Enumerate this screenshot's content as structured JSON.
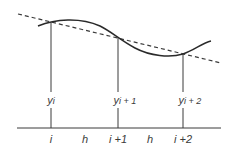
{
  "diagram": {
    "colors": {
      "stroke": "#3a3a3a",
      "background": "#ffffff"
    },
    "points": [
      {
        "x_px": 51,
        "y_px": 22,
        "y_label_base": "y",
        "y_label_sub": "i",
        "x_label": "i"
      },
      {
        "x_px": 118,
        "y_px": 38,
        "y_label_base": "y",
        "y_label_sub": "i + 1",
        "x_label": "i +1"
      },
      {
        "x_px": 183,
        "y_px": 54,
        "y_label_base": "y",
        "y_label_sub": "i + 2",
        "x_label": "i +2"
      }
    ],
    "spacing_labels": [
      "h",
      "h"
    ],
    "curve": "smooth function through y_i, y_i+1, y_i+2",
    "secant": "dashed straight line through (i, y_i) and (i+2, y_i+2)"
  }
}
